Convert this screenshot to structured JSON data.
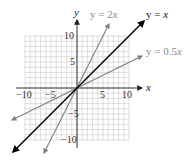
{
  "chart_data": {
    "type": "line",
    "title": "",
    "xlabel": "x",
    "ylabel": "y",
    "xlim": [
      -10,
      10
    ],
    "ylim": [
      -10,
      10
    ],
    "grid": true,
    "x_ticks": [
      -10,
      -5,
      5,
      10
    ],
    "y_ticks": [
      10,
      5,
      -5,
      -10
    ],
    "x_tick_labels": [
      "−10",
      "−5",
      "5",
      "10"
    ],
    "y_tick_labels": [
      "10",
      "5",
      "−5",
      "−10"
    ],
    "series": [
      {
        "name": "y = 2x",
        "slope": 2,
        "color": "#808080",
        "x": [
          -6.3,
          4.7
        ],
        "y": [
          -12.6,
          9.4
        ]
      },
      {
        "name": "y = x",
        "slope": 1,
        "color": "#000000",
        "x": [
          -12.5,
          12.5
        ],
        "y": [
          -12.5,
          12.5
        ]
      },
      {
        "name": "y = 0.5x",
        "slope": 0.5,
        "color": "#808080",
        "x": [
          -12.5,
          12.5
        ],
        "y": [
          -6.25,
          6.25
        ]
      }
    ]
  },
  "labels": {
    "x_axis": "x",
    "y_axis": "y",
    "line_2x_prefix": "y = 2",
    "line_2x_var": "x",
    "line_x_prefix": "y = ",
    "line_x_var": "x",
    "line_05x_prefix": "y = 0.5",
    "line_05x_var": "x",
    "tick_x_neg10": "−10",
    "tick_x_neg5": "−5",
    "tick_x_5": "5",
    "tick_x_10": "10",
    "tick_y_10": "10",
    "tick_y_5": "5",
    "tick_y_neg5": "−5",
    "tick_y_neg10": "−10"
  },
  "colors": {
    "grid": "#c8c8c8",
    "axis": "#333333",
    "line_primary": "#000000",
    "line_secondary": "#7f7f7f",
    "label_secondary": "#8a8a8a"
  }
}
